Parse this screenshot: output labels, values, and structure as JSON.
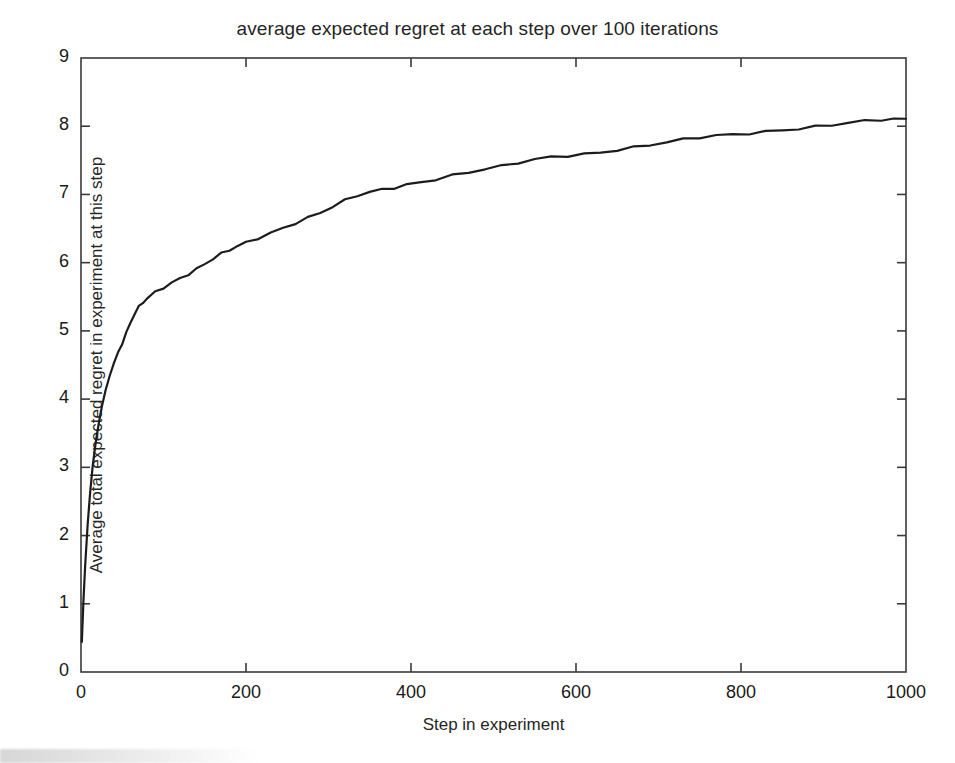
{
  "figure": {
    "background_color": "#ffffff",
    "axis_color": "#3a3a3a",
    "line_color": "#1c1c1c"
  },
  "chart_data": {
    "type": "line",
    "title": "average expected regret at each step over 100 iterations",
    "xlabel": "Step in experiment",
    "ylabel": "Average total expected regret in experiment at this step",
    "xlim": [
      0,
      1000
    ],
    "ylim": [
      0,
      9
    ],
    "xticks": [
      0,
      200,
      400,
      600,
      800,
      1000
    ],
    "yticks": [
      0,
      1,
      2,
      3,
      4,
      5,
      6,
      7,
      8,
      9
    ],
    "xtick_labels": [
      "0",
      "200",
      "400",
      "600",
      "800",
      "1000"
    ],
    "ytick_labels": [
      "0",
      "1",
      "2",
      "3",
      "4",
      "5",
      "6",
      "7",
      "8",
      "9"
    ],
    "grid": false,
    "legend": null,
    "series": [
      {
        "name": "average expected regret",
        "color": "#1c1c1c",
        "linewidth": 2.2,
        "x": [
          1,
          3,
          5,
          8,
          11,
          14,
          18,
          22,
          26,
          30,
          35,
          40,
          45,
          50,
          55,
          60,
          65,
          70,
          75,
          80,
          90,
          100,
          110,
          120,
          130,
          140,
          150,
          160,
          170,
          180,
          190,
          200,
          215,
          230,
          245,
          260,
          275,
          290,
          305,
          320,
          335,
          350,
          365,
          380,
          395,
          410,
          430,
          450,
          470,
          490,
          510,
          530,
          550,
          570,
          590,
          610,
          630,
          650,
          670,
          690,
          710,
          730,
          750,
          770,
          790,
          810,
          830,
          850,
          870,
          890,
          910,
          930,
          950,
          970,
          985,
          1000
        ],
        "y": [
          0.44,
          1.05,
          1.55,
          2.15,
          2.62,
          3.0,
          3.38,
          3.68,
          3.93,
          4.14,
          4.35,
          4.53,
          4.69,
          4.84,
          4.99,
          5.13,
          5.26,
          5.34,
          5.4,
          5.46,
          5.55,
          5.63,
          5.71,
          5.78,
          5.85,
          5.92,
          5.99,
          6.06,
          6.12,
          6.17,
          6.23,
          6.28,
          6.36,
          6.44,
          6.52,
          6.6,
          6.67,
          6.74,
          6.82,
          6.9,
          6.97,
          7.02,
          7.06,
          7.1,
          7.15,
          7.19,
          7.24,
          7.29,
          7.33,
          7.37,
          7.4,
          7.45,
          7.5,
          7.54,
          7.57,
          7.6,
          7.63,
          7.67,
          7.7,
          7.73,
          7.76,
          7.79,
          7.82,
          7.85,
          7.87,
          7.9,
          7.93,
          7.96,
          7.98,
          8.0,
          8.02,
          8.04,
          8.06,
          8.08,
          8.09,
          8.1
        ]
      }
    ]
  }
}
